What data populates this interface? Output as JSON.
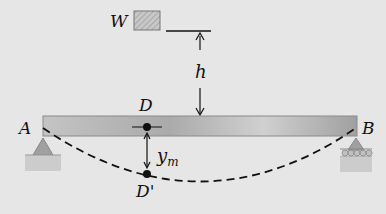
{
  "diagram": {
    "weight_label": "W",
    "height_label": "h",
    "point_d_label": "D",
    "point_d_prime_label": "D'",
    "support_a_label": "A",
    "support_b_label": "B",
    "deflection_label_main": "y",
    "deflection_label_sub": "m"
  },
  "colors": {
    "background": "#e6e6e6",
    "beam": "#b8b8b8",
    "weight_box": "#c0c0c0",
    "support": "#a8a8a8",
    "ground": "#c8c8c8"
  }
}
